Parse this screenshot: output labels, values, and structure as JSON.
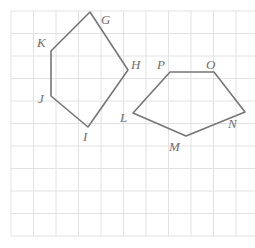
{
  "figure": {
    "title": "",
    "background_color": "#ffffff",
    "grid": {
      "visible": true,
      "line_color": "#e2e2e4",
      "cell_size_px": 22.5,
      "origin_x_px": 11,
      "origin_y_px": 11,
      "columns": 11,
      "rows": 10
    },
    "shapes": [
      {
        "name": "quadrilateral-ghijk",
        "stroke_color": "#767678",
        "stroke_width": 1.6,
        "fill": "none",
        "closed": true,
        "vertices": [
          {
            "label": "G",
            "x": 90,
            "y": 12,
            "label_x": 101,
            "label_y": 13
          },
          {
            "label": "H",
            "x": 128,
            "y": 70,
            "label_x": 131,
            "label_y": 58
          },
          {
            "label": "I",
            "x": 88,
            "y": 127,
            "label_x": 83,
            "label_y": 130
          },
          {
            "label": "J",
            "x": 51,
            "y": 96,
            "label_x": 38,
            "label_y": 92
          },
          {
            "label": "K",
            "x": 51,
            "y": 51,
            "label_x": 37,
            "label_y": 36
          }
        ]
      },
      {
        "name": "pentagon-lmnop",
        "stroke_color": "#767678",
        "stroke_width": 1.6,
        "fill": "none",
        "closed": true,
        "vertices": [
          {
            "label": "L",
            "x": 133,
            "y": 113,
            "label_x": 120,
            "label_y": 111
          },
          {
            "label": "M",
            "x": 186,
            "y": 136,
            "label_x": 169,
            "label_y": 140
          },
          {
            "label": "N",
            "x": 245,
            "y": 112,
            "label_x": 228,
            "label_y": 117
          },
          {
            "label": "O",
            "x": 214,
            "y": 72,
            "label_x": 206,
            "label_y": 58
          },
          {
            "label": "P",
            "x": 170,
            "y": 72,
            "label_x": 157,
            "label_y": 58
          }
        ]
      }
    ],
    "label_style": {
      "color": "#6e6e70",
      "font_size_px": 13,
      "italic": true
    }
  }
}
